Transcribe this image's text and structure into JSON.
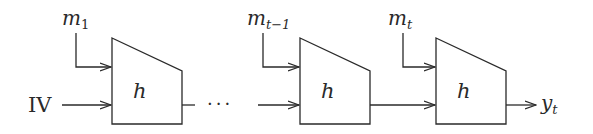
{
  "diagram": {
    "type": "recurrent-block-chain",
    "initial_input": "IV",
    "ellipsis": "···",
    "blocks": [
      {
        "label": "h",
        "input": {
          "base": "m",
          "sub": "1"
        }
      },
      {
        "label": "h",
        "input": {
          "base": "m",
          "sub": "t−1"
        }
      },
      {
        "label": "h",
        "input": {
          "base": "m",
          "sub": "t"
        }
      }
    ],
    "output": {
      "base": "y",
      "sub": "t"
    },
    "colors": {
      "stroke": "#2a2a2a",
      "background": "#ffffff"
    }
  }
}
